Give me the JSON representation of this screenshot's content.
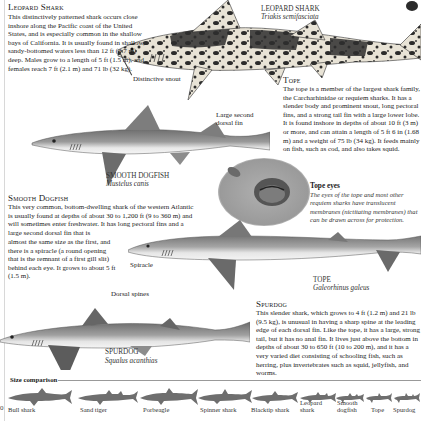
{
  "leopard_shark": {
    "heading": "Leopard Shark",
    "text": "This distinctively patterned shark occurs close inshore along the Pacific coast of the United States, and is especially common in the shallow bays of California. It is usually found in shallow, sandy-bottomed waters less than 12 ft (3.7 m) deep. Males grow to a length of 5 ft (1.5 m), and females reach 7 ft (2.1 m) and 71 lb (32 kg).",
    "annotation": "Distinctive snout",
    "caption_name": "LEOPARD SHARK",
    "caption_sci": "Triakis semifasciata"
  },
  "tope": {
    "heading": "Tope",
    "text": "The tope is a member of the largest shark family, the Carcharhinidae or requiem sharks. It has a slender body and prominent snout, long pectoral fins, and a strong tail fin with a large lower lobe. It is found inshore in depths of about 10 ft (3 m) or more, and can attain a length of 5 ft 6 in (1.68 m) and a weight of 75 lb (34 kg). It feeds mainly on fish, such as cod, and also takes squid.",
    "caption_name": "TOPE",
    "caption_sci": "Galeorhinus galeus"
  },
  "tope_eyes": {
    "title": "Tope eyes",
    "text": "The eyes of the tope and most other requiem sharks have translucent membranes (nictitating membranes) that can be drawn across for protection."
  },
  "smooth_dogfish": {
    "heading": "Smooth Dogfish",
    "text_wide": "This very common, bottom-dwelling shark of the western Atlantic is usually found at depths of about 30 to 1,200 ft (9 to 360 m) and will sometimes enter freshwater. It has long pectoral fins and a large second dorsal fin that is",
    "text_narrow": "almost the same size as the first, and there is a spiracle (a round opening that is the remnant of a first gill slit) behind each eye. It grows to about 5 ft (1.5 m).",
    "annotation": "Large second dorsal fin",
    "caption_name": "SMOOTH DOGFISH",
    "caption_sci": "Mustelus canis"
  },
  "spurdog": {
    "heading": "Spurdog",
    "text": "This slender shark, which grows to 4 ft (1.2 m) and 21 lb (9.5 kg), is unusual in having a sharp spine at the leading edge of each dorsal fin. Like the tope, it has a large, strong tail, but it has no anal fin. It lives just above the bottom in depths of about 30 to 650 ft (10 to 200 m), and it has a very varied diet consisting of schooling fish, such as herring, plus invertebrates such as squid, jellyfish, and worms.",
    "annotation_spiracle": "Spiracle",
    "annotation_spines": "Dorsal spines",
    "caption_name": "SPURDOG",
    "caption_sci": "Squalus acanthias"
  },
  "size_comparison": {
    "title": "Size comparison",
    "page_number": "0",
    "sharks": [
      {
        "label": "Bull shark",
        "x": 8,
        "w": 64
      },
      {
        "label": "Sand tiger",
        "x": 78,
        "w": 60
      },
      {
        "label": "Porbeagle",
        "x": 140,
        "w": 58
      },
      {
        "label": "Spinner shark",
        "x": 198,
        "w": 54
      },
      {
        "label": "Blacktip shark",
        "x": 252,
        "w": 46
      },
      {
        "label": "Leopard shark",
        "x": 300,
        "w": 36
      },
      {
        "label": "Smooth dogfish",
        "x": 336,
        "w": 28
      },
      {
        "label": "Tope",
        "x": 366,
        "w": 26
      },
      {
        "label": "Spurdog",
        "x": 394,
        "w": 26
      }
    ]
  },
  "colors": {
    "silhouette": "#6e6e6e",
    "shark_gray": "#8a8a8a",
    "leopard_dark": "#2a2a2a",
    "leopard_light": "#e6e2d8"
  }
}
